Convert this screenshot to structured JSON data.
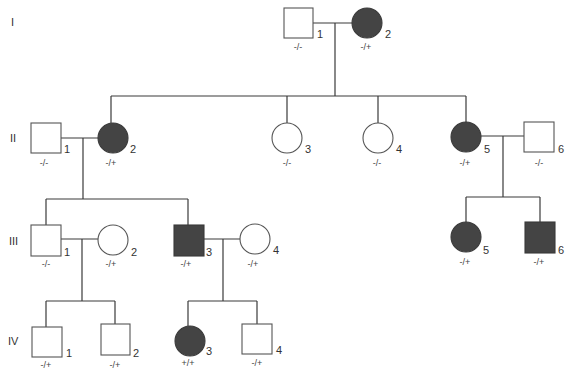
{
  "generations": [
    "I",
    "II",
    "III",
    "IV"
  ],
  "individuals": [
    {
      "id": "I-1",
      "number": "1",
      "sex": "male",
      "affected": false,
      "genotype": "-/-"
    },
    {
      "id": "I-2",
      "number": "2",
      "sex": "female",
      "affected": true,
      "genotype": "-/+"
    },
    {
      "id": "II-1",
      "number": "1",
      "sex": "male",
      "affected": false,
      "genotype": "-/-"
    },
    {
      "id": "II-2",
      "number": "2",
      "sex": "female",
      "affected": true,
      "genotype": "-/+"
    },
    {
      "id": "II-3",
      "number": "3",
      "sex": "female",
      "affected": false,
      "genotype": "-/-"
    },
    {
      "id": "II-4",
      "number": "4",
      "sex": "female",
      "affected": false,
      "genotype": "-/-"
    },
    {
      "id": "II-5",
      "number": "5",
      "sex": "female",
      "affected": true,
      "genotype": "-/+"
    },
    {
      "id": "II-6",
      "number": "6",
      "sex": "male",
      "affected": false,
      "genotype": "-/-"
    },
    {
      "id": "III-1",
      "number": "1",
      "sex": "male",
      "affected": false,
      "genotype": "-/-"
    },
    {
      "id": "III-2",
      "number": "2",
      "sex": "female",
      "affected": false,
      "genotype": "-/+"
    },
    {
      "id": "III-3",
      "number": "3",
      "sex": "male",
      "affected": true,
      "genotype": "-/+"
    },
    {
      "id": "III-4",
      "number": "4",
      "sex": "female",
      "affected": false,
      "genotype": "-/+"
    },
    {
      "id": "III-5",
      "number": "5",
      "sex": "female",
      "affected": true,
      "genotype": "-/+"
    },
    {
      "id": "III-6",
      "number": "6",
      "sex": "male",
      "affected": true,
      "genotype": "-/+"
    },
    {
      "id": "IV-1",
      "number": "1",
      "sex": "male",
      "affected": false,
      "genotype": "-/+"
    },
    {
      "id": "IV-2",
      "number": "2",
      "sex": "male",
      "affected": false,
      "genotype": "-/+"
    },
    {
      "id": "IV-3",
      "number": "3",
      "sex": "female",
      "affected": true,
      "genotype": "+/+"
    },
    {
      "id": "IV-4",
      "number": "4",
      "sex": "male",
      "affected": false,
      "genotype": "-/+"
    }
  ],
  "colors": {
    "affected_fill": "#444444",
    "unaffected_fill": "#ffffff",
    "line": "#3a3a3a"
  }
}
